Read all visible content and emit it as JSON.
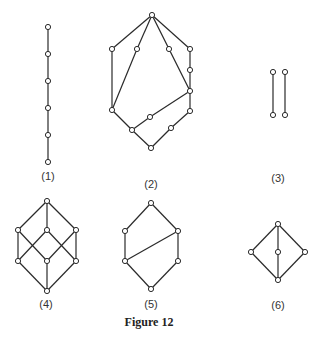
{
  "figure": {
    "caption": "Figure 12",
    "colors": {
      "stroke": "#2a2a2a",
      "node_fill": "#ffffff",
      "background": "#ffffff"
    },
    "diagrams": [
      {
        "label": "(1)",
        "label_pos": [
          48,
          176
        ],
        "nodes": [
          [
            48,
            27
          ],
          [
            48,
            54
          ],
          [
            48,
            81
          ],
          [
            48,
            108
          ],
          [
            48,
            135
          ],
          [
            48,
            162
          ]
        ],
        "edges": [
          [
            0,
            1
          ],
          [
            1,
            2
          ],
          [
            2,
            3
          ],
          [
            3,
            4
          ],
          [
            4,
            5
          ]
        ]
      },
      {
        "label": "(2)",
        "label_pos": [
          151,
          184
        ],
        "nodes": [
          [
            152,
            15
          ],
          [
            112,
            49
          ],
          [
            137,
            49
          ],
          [
            169,
            49
          ],
          [
            190,
            49
          ],
          [
            190,
            70
          ],
          [
            190,
            91
          ],
          [
            112,
            110
          ],
          [
            150,
            117
          ],
          [
            132,
            130
          ],
          [
            190,
            111
          ],
          [
            171,
            128
          ],
          [
            151,
            148
          ]
        ],
        "edges": [
          [
            0,
            1
          ],
          [
            0,
            2
          ],
          [
            0,
            3
          ],
          [
            0,
            4
          ],
          [
            1,
            7
          ],
          [
            2,
            7
          ],
          [
            3,
            6
          ],
          [
            4,
            5
          ],
          [
            5,
            6
          ],
          [
            6,
            8
          ],
          [
            8,
            9
          ],
          [
            7,
            9
          ],
          [
            9,
            12
          ],
          [
            6,
            10
          ],
          [
            10,
            11
          ],
          [
            11,
            12
          ]
        ]
      },
      {
        "label": "(3)",
        "label_pos": [
          278,
          178
        ],
        "nodes": [
          [
            273,
            72
          ],
          [
            273,
            115
          ],
          [
            285,
            72
          ],
          [
            285,
            115
          ]
        ],
        "edges": [
          [
            0,
            1
          ],
          [
            2,
            3
          ]
        ]
      },
      {
        "label": "(4)",
        "label_pos": [
          46,
          304
        ],
        "nodes": [
          [
            47,
            201
          ],
          [
            18,
            230
          ],
          [
            47,
            230
          ],
          [
            76,
            230
          ],
          [
            18,
            261
          ],
          [
            47,
            261
          ],
          [
            76,
            261
          ],
          [
            47,
            291
          ]
        ],
        "edges": [
          [
            0,
            1
          ],
          [
            0,
            2
          ],
          [
            0,
            3
          ],
          [
            1,
            4
          ],
          [
            1,
            5
          ],
          [
            2,
            4
          ],
          [
            2,
            6
          ],
          [
            3,
            5
          ],
          [
            3,
            6
          ],
          [
            4,
            7
          ],
          [
            5,
            7
          ],
          [
            6,
            7
          ]
        ]
      },
      {
        "label": "(5)",
        "label_pos": [
          151,
          304
        ],
        "nodes": [
          [
            151,
            203
          ],
          [
            125,
            231
          ],
          [
            178,
            231
          ],
          [
            125,
            261
          ],
          [
            178,
            261
          ],
          [
            151,
            289
          ]
        ],
        "edges": [
          [
            0,
            1
          ],
          [
            0,
            2
          ],
          [
            1,
            3
          ],
          [
            2,
            4
          ],
          [
            3,
            2
          ],
          [
            3,
            5
          ],
          [
            4,
            5
          ]
        ]
      },
      {
        "label": "(6)",
        "label_pos": [
          278,
          305
        ],
        "nodes": [
          [
            278,
            224
          ],
          [
            251,
            252
          ],
          [
            278,
            252
          ],
          [
            305,
            252
          ],
          [
            278,
            280
          ]
        ],
        "edges": [
          [
            0,
            1
          ],
          [
            0,
            2
          ],
          [
            0,
            3
          ],
          [
            1,
            4
          ],
          [
            2,
            4
          ],
          [
            3,
            4
          ]
        ]
      }
    ]
  }
}
